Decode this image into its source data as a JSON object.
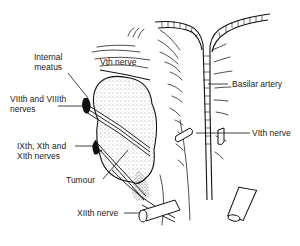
{
  "figure": {
    "type": "anatomical illustration",
    "background": "#ffffff",
    "ink": "#1a1a1a"
  },
  "labels": {
    "internal_meatus": "Internal meatus",
    "internal_meatus_line1": "Internal",
    "internal_meatus_line2": "meatus",
    "vth_nerve": "Vth nerve",
    "viith_viiith_line1": "VIIth and VIIIth",
    "viith_viiith_line2": "nerves",
    "basilar_artery": "Basilar artery",
    "vith_nerve": "VIth nerve",
    "ixth_xth_xith_line1": "IXth, Xth and",
    "ixth_xth_xith_line2": "XIth nerves",
    "tumour": "Tumour",
    "xiith_nerve": "XIIth nerve"
  }
}
